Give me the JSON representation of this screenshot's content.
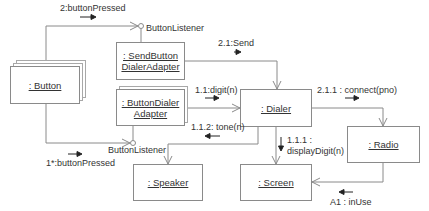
{
  "diagram": {
    "type": "UML collaboration diagram",
    "line_color": "#8a8a8a",
    "text_color": "#333333",
    "objects": [
      {
        "id": "button",
        "label": ": Button",
        "multi": true
      },
      {
        "id": "send_adapter",
        "label_line1": ": SendButton",
        "label_line2": "DialerAdapter",
        "multi": false
      },
      {
        "id": "button_adapter",
        "label_line1": ": ButtonDialer",
        "label_line2": "Adapter",
        "multi": true
      },
      {
        "id": "dialer",
        "label": ": Dialer",
        "multi": false
      },
      {
        "id": "radio",
        "label": ": Radio",
        "multi": false
      },
      {
        "id": "speaker",
        "label": ": Speaker",
        "multi": false
      },
      {
        "id": "screen",
        "label": ": Screen",
        "multi": false
      }
    ],
    "interfaces": [
      {
        "id": "listener_top",
        "label": "ButtonListener"
      },
      {
        "id": "listener_bottom",
        "label": "ButtonListener"
      }
    ],
    "messages": [
      {
        "id": "m_button_pressed_2",
        "label": "2:buttonPressed",
        "direction": "right"
      },
      {
        "id": "m_send",
        "label": "2.1:Send",
        "direction": "right"
      },
      {
        "id": "m_digit",
        "label": "1.1:digit(n)",
        "direction": "right"
      },
      {
        "id": "m_tone",
        "label": "1.1.2: tone(n)",
        "direction": "left"
      },
      {
        "id": "m_connect",
        "label": "2.1.1 : connect(pno)",
        "direction": "right"
      },
      {
        "id": "m_display_line1",
        "label": "1.1.1 :",
        "direction": "down"
      },
      {
        "id": "m_display_line2",
        "label": "displayDigit(n)"
      },
      {
        "id": "m_button_pressed_1",
        "label": "1*:buttonPressed",
        "direction": "right"
      },
      {
        "id": "m_in_use",
        "label": "A1 : inUse",
        "direction": "left"
      }
    ]
  }
}
